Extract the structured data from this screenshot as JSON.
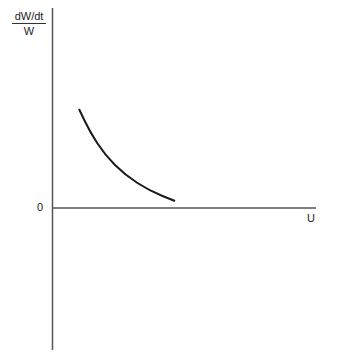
{
  "chart_data": {
    "type": "line",
    "title": "",
    "ylabel": {
      "numerator": "dW/dt",
      "denominator": "W"
    },
    "xlabel": "U",
    "origin_label": "0",
    "grid": false,
    "legend": null,
    "series": [
      {
        "name": "dW/dt / W vs U",
        "description": "convex decreasing curve, positive, approaching zero",
        "points_px": [
          [
            79,
            109
          ],
          [
            90,
            132
          ],
          [
            105,
            155
          ],
          [
            125,
            175
          ],
          [
            150,
            191
          ],
          [
            175,
            201
          ]
        ]
      }
    ],
    "axes": {
      "x_axis_y_px": 208,
      "y_axis_x_px": 52,
      "y_top_px": 8,
      "y_bottom_px": 350,
      "x_right_px": 316
    }
  }
}
